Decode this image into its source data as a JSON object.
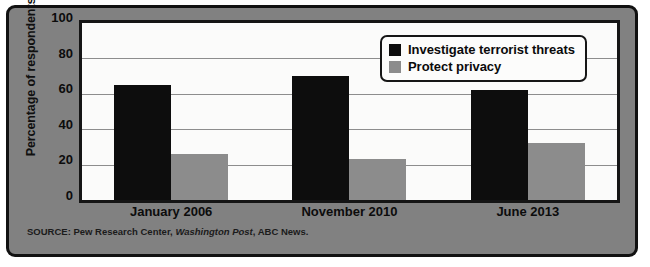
{
  "chart_data": {
    "type": "bar",
    "title": "",
    "subtitle": "",
    "xlabel": "",
    "ylabel": "Percentage of respondents",
    "ylim": [
      0,
      100
    ],
    "yticks": [
      0,
      20,
      40,
      60,
      80,
      100
    ],
    "grid": true,
    "legend_position": "top-right",
    "categories": [
      "January 2006",
      "November 2010",
      "June 2013"
    ],
    "series": [
      {
        "name": "Investigate terrorist threats",
        "color": "#0d0d0d",
        "values": [
          65,
          70,
          62
        ]
      },
      {
        "name": "Protect privacy",
        "color": "#8c8c8c",
        "values": [
          26,
          23,
          32
        ]
      }
    ],
    "annotations": []
  },
  "source": {
    "prefix": "SOURCE: Pew Research Center,",
    "italic": "Washington Post",
    "suffix": ", ABC News."
  },
  "colors": {
    "figure_background": "#818181",
    "plot_background": "#fbfbfa",
    "frame": "#111111",
    "gridline": "#8d8d8d",
    "series_a": "#0d0d0d",
    "series_b": "#8c8c8c"
  }
}
